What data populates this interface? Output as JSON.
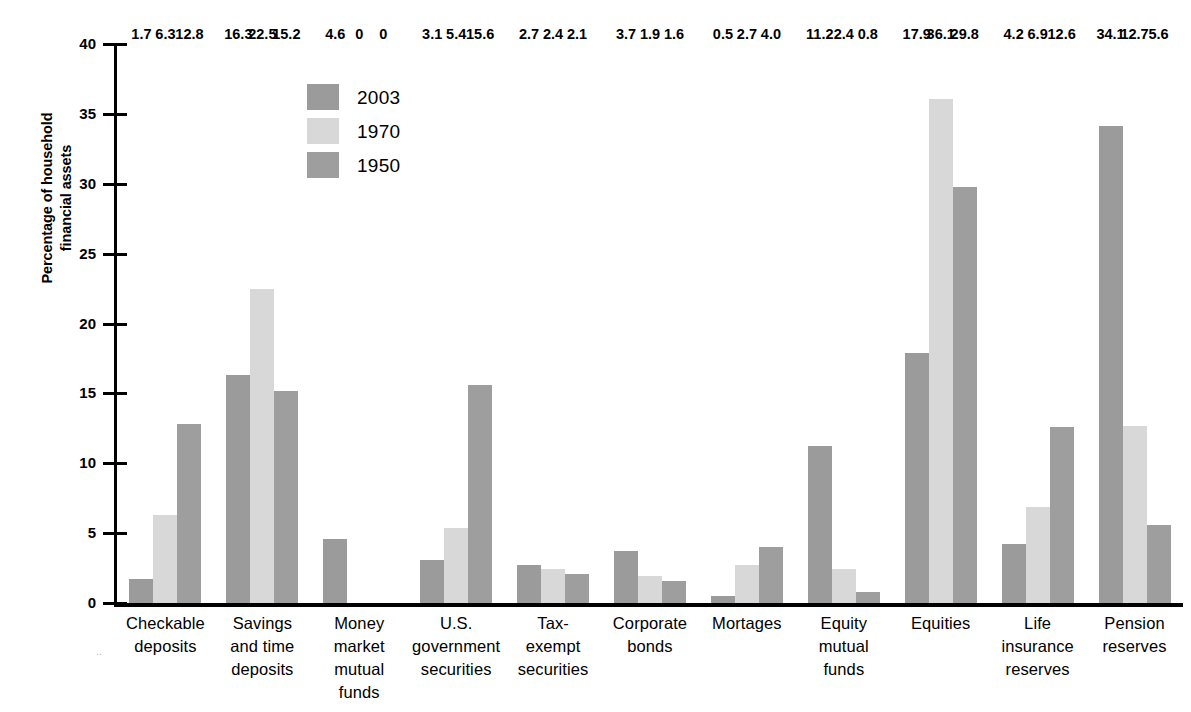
{
  "chart_data": {
    "type": "bar",
    "title": "",
    "subtitle": "",
    "xlabel": "",
    "ylabel": "Percentage of household\nfinancial assets",
    "ylim": [
      0,
      40
    ],
    "yticks": [
      0,
      5,
      10,
      15,
      20,
      25,
      30,
      35,
      40
    ],
    "ytick_labels": [
      "0",
      "5",
      "10",
      "15",
      "20",
      "25",
      "30",
      "35",
      "40"
    ],
    "grid": false,
    "legend_position": "upper-left-inside",
    "categories": [
      "Checkable\ndeposits",
      "Savings\nand time\ndeposits",
      "Money\nmarket\nmutual\nfunds",
      "U.S.\ngovernment\nsecurities",
      "Tax-\nexempt\nsecurities",
      "Corporate\nbonds",
      "Mortages",
      "Equity\nmutual\nfunds",
      "Equities",
      "Life\ninsurance\nreserves",
      "Pension\nreserves"
    ],
    "series": [
      {
        "name": "2003",
        "color": "#9b9b9b",
        "values": [
          1.7,
          16.3,
          4.6,
          3.1,
          2.7,
          3.7,
          0.5,
          11.2,
          17.9,
          4.2,
          34.1
        ],
        "labels": [
          "1.7",
          "16.3",
          "4.6",
          "3.1",
          "2.7",
          "3.7",
          "0.5",
          "11.2",
          "17.9",
          "4.2",
          "34.1"
        ]
      },
      {
        "name": "1970",
        "color": "#d8d8d8",
        "values": [
          6.3,
          22.5,
          0,
          5.4,
          2.4,
          1.9,
          2.7,
          2.4,
          36.1,
          6.9,
          12.7
        ],
        "labels": [
          "6.3",
          "22.5",
          "0",
          "5.4",
          "2.4",
          "1.9",
          "2.7",
          "2.4",
          "36.1",
          "6.9",
          "12.7"
        ]
      },
      {
        "name": "1950",
        "color": "#9e9e9e",
        "values": [
          12.8,
          15.2,
          0,
          15.6,
          2.1,
          1.6,
          4.0,
          0.8,
          29.8,
          12.6,
          5.6
        ],
        "labels": [
          "12.8",
          "15.2",
          "0",
          "15.6",
          "2.1",
          "1.6",
          "4.0",
          "0.8",
          "29.8",
          "12.6",
          "5.6"
        ]
      }
    ]
  },
  "axis": {
    "y_title": "Percentage of household\nfinancial assets",
    "ticks": [
      {
        "label": "40",
        "value": 40
      },
      {
        "label": "35",
        "value": 35
      },
      {
        "label": "30",
        "value": 30
      },
      {
        "label": "25",
        "value": 25
      },
      {
        "label": "20",
        "value": 20
      },
      {
        "label": "15",
        "value": 15
      },
      {
        "label": "10",
        "value": 10
      },
      {
        "label": "5",
        "value": 5
      },
      {
        "label": "0",
        "value": 0
      }
    ]
  },
  "legend": {
    "items": [
      {
        "label": "2003",
        "color": "#9b9b9b"
      },
      {
        "label": "1970",
        "color": "#d8d8d8"
      },
      {
        "label": "1950",
        "color": "#9e9e9e"
      }
    ]
  },
  "artifacts": {
    "scan_mark": ".."
  }
}
